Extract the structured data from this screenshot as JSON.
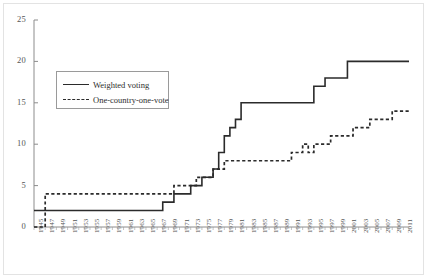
{
  "chart_data": {
    "type": "line",
    "title": "",
    "subtitle": "",
    "xlabel": "",
    "ylabel": "",
    "xlim": [
      1945,
      2012
    ],
    "ylim": [
      0,
      25
    ],
    "yticks": [
      0,
      5,
      10,
      15,
      20,
      25
    ],
    "ytick_labels": [
      "0",
      "5",
      "10",
      "15",
      "20",
      "25"
    ],
    "grid": false,
    "legend_position": "upper-left-inside",
    "step_style": "post",
    "xtick_labels": [
      "1945",
      "1947",
      "1949",
      "1951",
      "1953",
      "1955",
      "1957",
      "1959",
      "1961",
      "1963",
      "1965",
      "1967",
      "1969",
      "1971",
      "1973",
      "1975",
      "1977",
      "1979",
      "1981",
      "1983",
      "1985",
      "1987",
      "1989",
      "1991",
      "1993",
      "1995",
      "1997",
      "1999",
      "2001",
      "2003",
      "2005",
      "2007",
      "2009",
      "2011"
    ],
    "x": [
      1945,
      1946,
      1947,
      1948,
      1949,
      1950,
      1951,
      1952,
      1953,
      1954,
      1955,
      1956,
      1957,
      1958,
      1959,
      1960,
      1961,
      1962,
      1963,
      1964,
      1965,
      1966,
      1967,
      1968,
      1969,
      1970,
      1971,
      1972,
      1973,
      1974,
      1975,
      1976,
      1977,
      1978,
      1979,
      1980,
      1981,
      1982,
      1983,
      1984,
      1985,
      1986,
      1987,
      1988,
      1989,
      1990,
      1991,
      1992,
      1993,
      1994,
      1995,
      1996,
      1997,
      1998,
      1999,
      2000,
      2001,
      2002,
      2003,
      2004,
      2005,
      2006,
      2007,
      2008,
      2009,
      2010,
      2011,
      2012
    ],
    "series": [
      {
        "name": "Weighted voting",
        "style": "solid",
        "color": "#2b2b2b",
        "values": [
          2,
          2,
          2,
          2,
          2,
          2,
          2,
          2,
          2,
          2,
          2,
          2,
          2,
          2,
          2,
          2,
          2,
          2,
          2,
          2,
          2,
          2,
          2,
          3,
          3,
          4,
          4,
          4,
          5,
          5,
          6,
          6,
          7,
          9,
          11,
          12,
          13,
          15,
          15,
          15,
          15,
          15,
          15,
          15,
          15,
          15,
          15,
          15,
          15,
          15,
          17,
          17,
          18,
          18,
          18,
          18,
          20,
          20,
          20,
          20,
          20,
          20,
          20,
          20,
          20,
          20,
          20,
          20
        ]
      },
      {
        "name": "One-country-one-vote",
        "style": "dashed",
        "color": "#2b2b2b",
        "values": [
          0,
          0,
          4,
          4,
          4,
          4,
          4,
          4,
          4,
          4,
          4,
          4,
          4,
          4,
          4,
          4,
          4,
          4,
          4,
          4,
          4,
          4,
          4,
          4,
          4,
          5,
          5,
          5,
          5,
          6,
          6,
          6,
          7,
          7,
          8,
          8,
          8,
          8,
          8,
          8,
          8,
          8,
          8,
          8,
          8,
          8,
          9,
          9,
          10,
          9,
          10,
          10,
          10,
          11,
          11,
          11,
          11,
          12,
          12,
          12,
          13,
          13,
          13,
          13,
          14,
          14,
          14,
          14
        ]
      }
    ]
  }
}
